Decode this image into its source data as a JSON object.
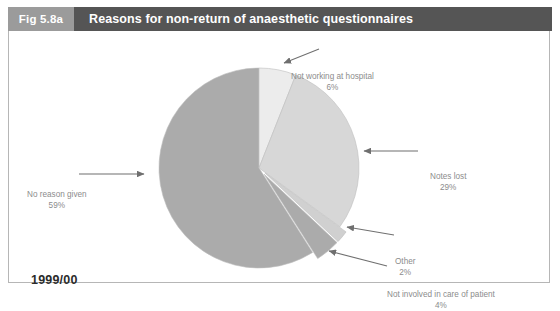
{
  "header": {
    "fig_number": "Fig 5.8a",
    "title": "Reasons for non-return of anaesthetic questionnaires",
    "fig_number_bg": "#9b9b9b",
    "title_bg": "#555555",
    "text_color": "#ffffff"
  },
  "year_label": "1999/00",
  "annotations": {
    "not_working": {
      "label": "Not working at hospital",
      "percent": "6%"
    },
    "notes_lost": {
      "label": "Notes lost",
      "percent": "29%"
    },
    "other": {
      "label": "Other",
      "percent": "2%"
    },
    "not_involved": {
      "label": "Not involved in care of patient",
      "percent": "4%"
    },
    "no_reason": {
      "label": "No reason given",
      "percent": "59%"
    }
  },
  "chart_data": {
    "type": "pie",
    "title": "Reasons for non-return of anaesthetic questionnaires",
    "subtitle": "1999/00",
    "xlabel": "",
    "ylabel": "",
    "legend_position": "none",
    "grid": false,
    "units": "percent",
    "start_angle_deg": 0,
    "direction": "clockwise",
    "categories": [
      "Not working at hospital",
      "Notes lost",
      "Other",
      "Not involved in care of patient",
      "No reason given"
    ],
    "values": [
      6,
      29,
      2,
      4,
      59
    ],
    "labels": [
      "6%",
      "29%",
      "2%",
      "4%",
      "59%"
    ],
    "colors": [
      "#ececec",
      "#d7d7d7",
      "#d0d0d0",
      "#ababab",
      "#ababab"
    ],
    "exploded": [
      false,
      false,
      true,
      true,
      false
    ],
    "total": 100
  },
  "palette": {
    "slice_light": "#ececec",
    "slice_mid_light": "#d7d7d7",
    "slice_other": "#d0d0d0",
    "slice_dark": "#ababab",
    "slice_stroke": "#bdbdbd",
    "annotation_text": "#8c8c8c",
    "arrow": "#6f6f6f",
    "panel_border": "#b6b6b6",
    "year_text": "#2b2b2b"
  }
}
